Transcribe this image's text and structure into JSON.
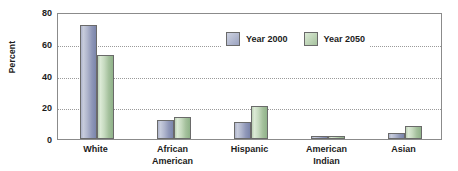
{
  "chart_data": {
    "type": "bar",
    "title": "",
    "subtitle": "",
    "xlabel": "",
    "ylabel": "Percent",
    "ylim": [
      0,
      80
    ],
    "yticks": [
      0,
      20,
      40,
      60,
      80
    ],
    "grid": true,
    "legend_position": "top-right-inside",
    "categories": [
      "White",
      "African\nAmerican",
      "Hispanic",
      "American\nIndian",
      "Asian"
    ],
    "series": [
      {
        "name": "Year 2000",
        "color": "#9aa2c0",
        "values": [
          72,
          12,
          11,
          2,
          4
        ]
      },
      {
        "name": "Year 2050",
        "color": "#a6c29e",
        "values": [
          53,
          14,
          21,
          2,
          8
        ]
      }
    ]
  },
  "axis": {
    "y_title": "Percent",
    "y_tick_labels": [
      "80",
      "60",
      "40",
      "20",
      "0"
    ]
  },
  "legend": {
    "entries": [
      {
        "label": "Year 2000",
        "swatch": "legend-swatch-year-2000"
      },
      {
        "label": "Year 2050",
        "swatch": "legend-swatch-year-2050"
      }
    ]
  },
  "x_axis": {
    "labels": [
      "White",
      "African\nAmerican",
      "Hispanic",
      "American\nIndian",
      "Asian"
    ]
  }
}
